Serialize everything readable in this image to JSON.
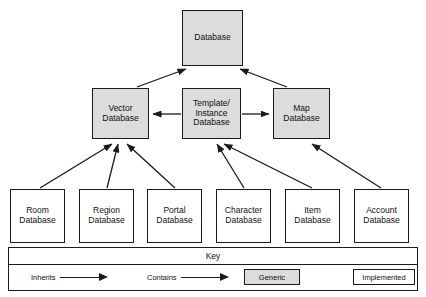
{
  "diagram": {
    "colors": {
      "generic_fill": "#dcdcdc",
      "implemented_fill": "#ffffff",
      "stroke": "#1a1a1a"
    },
    "nodes": {
      "database": "Database",
      "vector": "Vector\nDatabase",
      "template": "Template/\nInstance\nDatabase",
      "map": "Map\nDatabase",
      "room": "Room\nDatabase",
      "region": "Region\nDatabase",
      "portal": "Portal\nDatabase",
      "character": "Character\nDatabase",
      "item": "Item\nDatabase",
      "account": "Account\nDatabase"
    },
    "edges": [
      {
        "from": "vector",
        "to": "database",
        "type": "Inherits"
      },
      {
        "from": "map",
        "to": "database",
        "type": "Inherits"
      },
      {
        "from": "template",
        "to": "vector",
        "type": "Contains"
      },
      {
        "from": "template",
        "to": "map",
        "type": "Contains"
      },
      {
        "from": "room",
        "to": "vector",
        "type": "Inherits"
      },
      {
        "from": "region",
        "to": "vector",
        "type": "Inherits"
      },
      {
        "from": "portal",
        "to": "vector",
        "type": "Inherits"
      },
      {
        "from": "character",
        "to": "template",
        "type": "Inherits"
      },
      {
        "from": "item",
        "to": "template",
        "type": "Inherits"
      },
      {
        "from": "account",
        "to": "map",
        "type": "Inherits"
      }
    ]
  },
  "key": {
    "title": "Key",
    "inherits_label": "Inherits",
    "contains_label": "Contains",
    "generic_label": "Generic",
    "implemented_label": "Implemented"
  }
}
